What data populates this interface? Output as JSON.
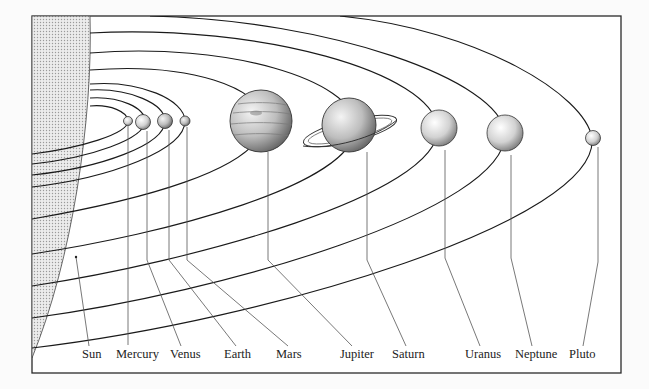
{
  "diagram": {
    "colors": {
      "background": "#fbfbfb",
      "ink": "#1a1a1a",
      "leader": "#555555",
      "sun_fill": "#d9d9d9"
    },
    "labels": [
      {
        "id": "sun",
        "text": "Sun",
        "x": 82
      },
      {
        "id": "mercury",
        "text": "Mercury",
        "x": 116
      },
      {
        "id": "venus",
        "text": "Venus",
        "x": 170
      },
      {
        "id": "earth",
        "text": "Earth",
        "x": 224
      },
      {
        "id": "mars",
        "text": "Mars",
        "x": 276
      },
      {
        "id": "jupiter",
        "text": "Jupiter",
        "x": 340
      },
      {
        "id": "saturn",
        "text": "Saturn",
        "x": 392
      },
      {
        "id": "uranus",
        "text": "Uranus",
        "x": 465
      },
      {
        "id": "neptune",
        "text": "Neptune",
        "x": 515
      },
      {
        "id": "pluto",
        "text": "Pluto",
        "x": 569
      }
    ]
  }
}
